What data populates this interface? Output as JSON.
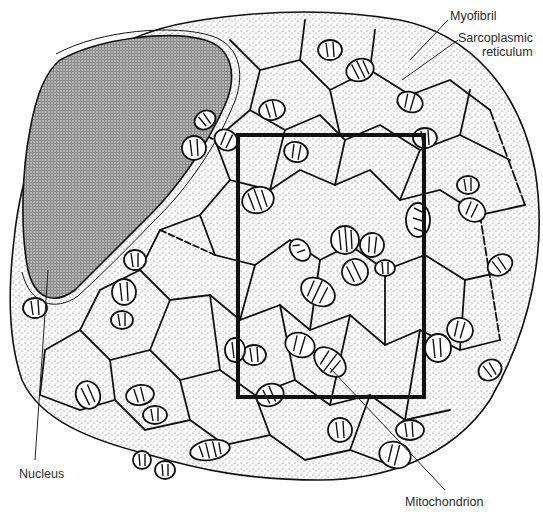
{
  "figure": {
    "labels": {
      "myofibril": "Myofibril",
      "sarcoplasmic_reticulum_line1": "Sarcoplasmic",
      "sarcoplasmic_reticulum_line2": "reticulum",
      "nucleus": "Nucleus",
      "mitochondrion": "Mitochondrion"
    },
    "colors": {
      "ink": "#111111",
      "background": "#ffffff",
      "nucleus_fill": "#9a9a9a",
      "stipple": "#555555"
    },
    "highlight_box": {
      "x": 238,
      "y": 135,
      "width": 186,
      "height": 262
    }
  }
}
